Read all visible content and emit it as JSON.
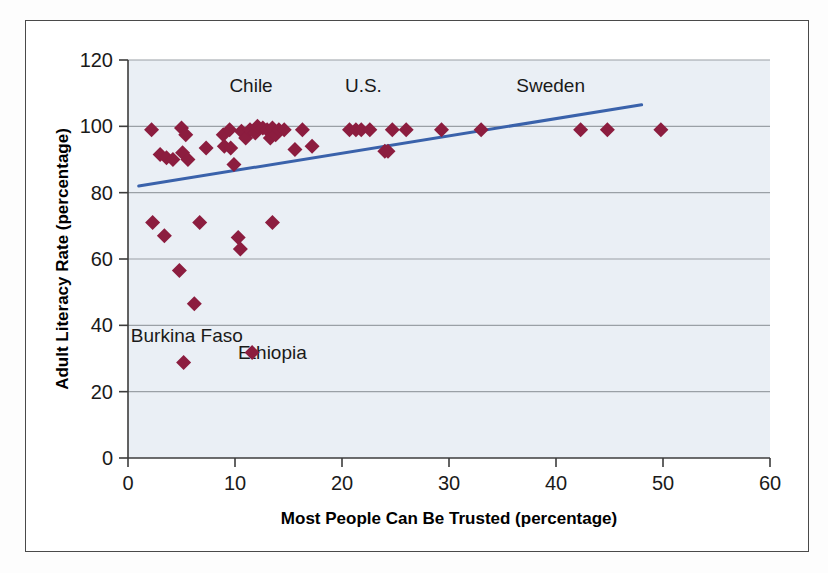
{
  "chart_data": {
    "type": "scatter",
    "title": "",
    "subtitle": "",
    "xlabel": "Most People Can Be Trusted (percentage)",
    "ylabel": "Adult Literacy Rate (percentage)",
    "xlim": [
      0,
      60
    ],
    "ylim": [
      0,
      120
    ],
    "xticks": [
      0,
      10,
      20,
      30,
      40,
      50,
      60
    ],
    "yticks": [
      0,
      20,
      40,
      60,
      80,
      100,
      120
    ],
    "xtick_labels": [
      "0",
      "10",
      "20",
      "30",
      "40",
      "50",
      "60"
    ],
    "ytick_labels": [
      "0",
      "20",
      "40",
      "60",
      "80",
      "100",
      "120"
    ],
    "grid": "horizontal",
    "legend": "none",
    "marker": "diamond",
    "marker_color": "#8c1d3f",
    "plot_background": "#eaeff5",
    "gridline_color": "#9aa0a6",
    "trendline": {
      "color": "#3a62ab",
      "x_start": 1.0,
      "y_start": 82.0,
      "x_end": 48.0,
      "y_end": 106.5
    },
    "annotations": [
      {
        "text": "Chile",
        "x": 11.5,
        "y": 110.5
      },
      {
        "text": "U.S.",
        "x": 22.0,
        "y": 110.5
      },
      {
        "text": "Sweden",
        "x": 39.5,
        "y": 110.5
      },
      {
        "text": "Burkina Faso",
        "x": 5.5,
        "y": 35.0
      },
      {
        "text": "Ethiopia",
        "x": 13.5,
        "y": 30.0
      }
    ],
    "legend_marker": {
      "x": 11.6,
      "y": 30.0
    },
    "series": [
      {
        "name": "Countries",
        "points": [
          [
            2.2,
            99.0
          ],
          [
            3.0,
            91.5
          ],
          [
            3.6,
            90.5
          ],
          [
            4.2,
            90.0
          ],
          [
            5.0,
            99.5
          ],
          [
            5.4,
            97.5
          ],
          [
            5.1,
            92.0
          ],
          [
            5.6,
            90.0
          ],
          [
            7.3,
            93.5
          ],
          [
            8.9,
            97.5
          ],
          [
            9.5,
            99.0
          ],
          [
            9.0,
            94.0
          ],
          [
            9.6,
            93.5
          ],
          [
            9.9,
            88.5
          ],
          [
            10.6,
            98.5
          ],
          [
            11.0,
            96.5
          ],
          [
            11.4,
            99.0
          ],
          [
            11.9,
            98.0
          ],
          [
            12.1,
            100.0
          ],
          [
            12.6,
            99.5
          ],
          [
            13.0,
            99.0
          ],
          [
            13.3,
            96.5
          ],
          [
            13.5,
            99.5
          ],
          [
            13.8,
            97.5
          ],
          [
            14.1,
            99.0
          ],
          [
            14.6,
            99.0
          ],
          [
            15.6,
            93.0
          ],
          [
            16.3,
            99.0
          ],
          [
            17.2,
            94.0
          ],
          [
            20.7,
            99.0
          ],
          [
            21.3,
            99.0
          ],
          [
            21.8,
            99.0
          ],
          [
            22.6,
            99.0
          ],
          [
            24.0,
            92.5
          ],
          [
            24.3,
            92.5
          ],
          [
            24.7,
            99.0
          ],
          [
            26.0,
            99.0
          ],
          [
            29.3,
            99.0
          ],
          [
            33.0,
            99.0
          ],
          [
            42.3,
            99.0
          ],
          [
            44.8,
            99.0
          ],
          [
            49.8,
            99.0
          ],
          [
            2.3,
            71.0
          ],
          [
            3.4,
            67.0
          ],
          [
            4.8,
            56.5
          ],
          [
            6.7,
            71.0
          ],
          [
            6.2,
            46.5
          ],
          [
            10.3,
            66.5
          ],
          [
            10.5,
            63.0
          ],
          [
            13.5,
            71.0
          ],
          [
            5.2,
            28.8
          ]
        ]
      }
    ],
    "highlighted_points": [
      {
        "label": "Chile",
        "x": 12.1,
        "y": 100.0
      },
      {
        "label": "U.S.",
        "x": 24.0,
        "y": 92.5
      },
      {
        "label": "Sweden",
        "x": 42.3,
        "y": 99.0
      },
      {
        "label": "Burkina Faso",
        "x": 5.2,
        "y": 28.8
      },
      {
        "label": "Ethiopia",
        "x": 11.6,
        "y": 30.0
      }
    ]
  }
}
